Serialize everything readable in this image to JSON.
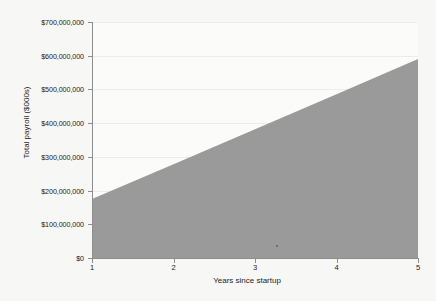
{
  "chart_data": {
    "type": "area",
    "title": "",
    "xlabel": "Years since startup",
    "ylabel": "Total payroll ($000s)",
    "x": [
      1,
      2,
      3,
      4,
      5
    ],
    "values": [
      175000000,
      278000000,
      382000000,
      486000000,
      590000000
    ],
    "series": [
      {
        "name": "Total payroll",
        "values": [
          175000000,
          278000000,
          382000000,
          486000000,
          590000000
        ]
      }
    ],
    "xlim": [
      1,
      5
    ],
    "ylim": [
      0,
      700000000
    ],
    "x_tick_labels": [
      "1",
      "2",
      "3",
      "4",
      "5"
    ],
    "y_tick_values": [
      0,
      100000000,
      200000000,
      300000000,
      400000000,
      500000000,
      600000000,
      700000000
    ],
    "y_tick_labels": [
      "$0",
      "$100,000,000",
      "$200,000,000",
      "$300,000,000",
      "$400,000,000",
      "$500,000,000",
      "$600,000,000",
      "$700,000,000"
    ],
    "grid": true,
    "legend": false,
    "legend_position": "none",
    "colors": {
      "area_fill": "#9a9a9a",
      "background": "#f7f7f5",
      "plot_background": "#fbfbfa",
      "axis": "#8d8d8d",
      "gridline": "#ececea",
      "text": "#1c1c1c"
    }
  }
}
